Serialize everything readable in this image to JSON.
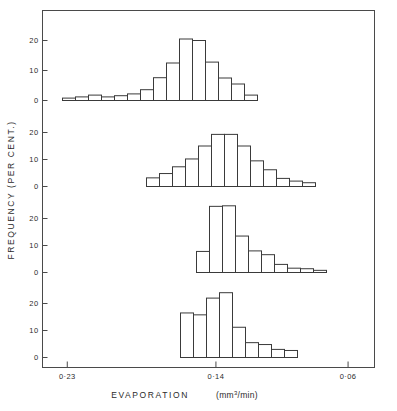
{
  "figure": {
    "background_color": "#ffffff",
    "line_color": "#3a3a3a",
    "axis_color": "#4a4a4a"
  },
  "axis": {
    "x_title": "EVAPORATION",
    "x_units_prefix": "(mm",
    "x_units_sup": "3",
    "x_units_suffix": "/min)",
    "y_title": "FREQUENCY  (PER CENT.)",
    "x_tick_labels": [
      "0·23",
      "0·14",
      "0·06"
    ],
    "y_tick_labels": [
      "0",
      "10",
      "20"
    ]
  },
  "chart_data": {
    "type": "bar",
    "title": "",
    "subtitle": "",
    "xlabel": "EVAPORATION  (mm3/min)",
    "ylabel": "FREQUENCY (PER CENT.)",
    "xlim": [
      0.245,
      0.044
    ],
    "x_axis_reversed": true,
    "x_ticks": [
      0.23,
      0.14,
      0.06
    ],
    "x_tick_labels": [
      "0·23",
      "0·14",
      "0·06"
    ],
    "ylim": [
      0,
      24
    ],
    "y_ticks": [
      0,
      10,
      20
    ],
    "grid": false,
    "legend": null,
    "bin_width_px": 13,
    "panels": [
      {
        "name": "panel-1",
        "index": 0,
        "baseline_y_px": 100,
        "unit_px_per_10": 30,
        "first_bin_left_px": 62,
        "values": [
          0.8,
          1.2,
          1.8,
          1.2,
          1.6,
          2.2,
          3.6,
          7.6,
          12.5,
          20.5,
          20.0,
          12.8,
          7.5,
          5.5,
          1.8
        ]
      },
      {
        "name": "panel-2",
        "index": 1,
        "baseline_y_px": 186,
        "unit_px_per_10": 27,
        "first_bin_left_px": 146,
        "values": [
          3.2,
          4.8,
          7.3,
          10.2,
          15.0,
          19.3,
          19.3,
          15.0,
          9.5,
          6.2,
          3.0,
          2.0,
          1.4
        ]
      },
      {
        "name": "panel-3",
        "index": 2,
        "baseline_y_px": 272,
        "unit_px_per_10": 27,
        "first_bin_left_px": 196,
        "values": [
          7.8,
          24.5,
          24.7,
          13.5,
          8.0,
          6.6,
          3.0,
          1.6,
          1.4,
          0.8
        ]
      },
      {
        "name": "panel-4",
        "index": 3,
        "baseline_y_px": 357,
        "unit_px_per_10": 27,
        "first_bin_left_px": 180,
        "values": [
          16.5,
          15.8,
          22.0,
          24.0,
          11.2,
          5.5,
          4.8,
          3.0,
          2.6
        ]
      }
    ]
  }
}
